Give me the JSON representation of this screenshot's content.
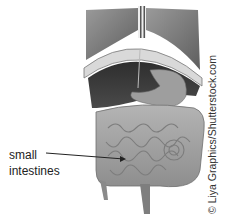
{
  "figure": {
    "label": {
      "line1": "small",
      "line2": "intestines"
    },
    "credit": "© Liya Graphics/Shutterstock.com",
    "palette": {
      "dark": "#3a3a3a",
      "mid": "#8a8a8a",
      "light": "#c8c8c8",
      "bg": "#ffffff"
    }
  }
}
